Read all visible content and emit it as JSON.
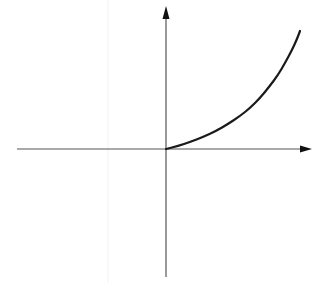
{
  "chart_data": {
    "type": "line",
    "title": "",
    "xlabel": "",
    "ylabel": "",
    "grid": false,
    "legend": null,
    "axes": {
      "origin_px": [
        166,
        149
      ],
      "x_axis": {
        "from_px": 17,
        "to_px": 312,
        "arrow": true
      },
      "y_axis": {
        "from_px": 277,
        "to_px": 6,
        "arrow": true
      },
      "ticks": []
    },
    "series": [
      {
        "name": "curve",
        "color": "#1a1a1a",
        "points_px": [
          [
            166,
            149
          ],
          [
            178,
            146
          ],
          [
            190,
            142
          ],
          [
            203,
            137
          ],
          [
            216,
            131
          ],
          [
            228,
            124
          ],
          [
            240,
            116
          ],
          [
            250,
            108
          ],
          [
            260,
            98
          ],
          [
            269,
            87
          ],
          [
            278,
            75
          ],
          [
            285,
            63
          ],
          [
            292,
            50
          ],
          [
            297,
            39
          ],
          [
            300,
            31
          ]
        ],
        "x": [
          0,
          0.1,
          0.2,
          0.3,
          0.4,
          0.5,
          0.6,
          0.7,
          0.8,
          0.9,
          1.0,
          1.1,
          1.2,
          1.3,
          1.35
        ],
        "y": [
          0.0,
          0.03,
          0.06,
          0.1,
          0.15,
          0.21,
          0.27,
          0.34,
          0.43,
          0.52,
          0.62,
          0.72,
          0.84,
          0.93,
          1.0
        ]
      }
    ]
  },
  "colors": {
    "background": "#ffffff",
    "axis": "#555555",
    "curve": "#1a1a1a",
    "artifact": "#f2f2f2"
  }
}
